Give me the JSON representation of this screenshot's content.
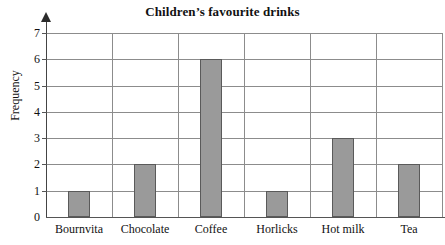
{
  "chart_data": {
    "type": "bar",
    "title": "Children’s favourite drinks",
    "xlabel": "",
    "ylabel": "Frequency",
    "categories": [
      "Bournvita",
      "Chocolate",
      "Coffee",
      "Horlicks",
      "Hot milk",
      "Tea"
    ],
    "values": [
      1,
      2,
      6,
      1,
      3,
      2
    ],
    "ylim": [
      0,
      7
    ],
    "ytick_labels": [
      "0",
      "1",
      "2",
      "3",
      "4",
      "5",
      "6",
      "7"
    ],
    "ytick_values": [
      0,
      1,
      2,
      3,
      4,
      5,
      6,
      7
    ],
    "grid": "both",
    "legend": "none",
    "bar_fill_color": "#9a9a9a",
    "bar_edge_color": "#5a5a5a",
    "grid_color": "#8c8c8c",
    "axis_color": "#444444",
    "background_color": "#ffffff"
  }
}
